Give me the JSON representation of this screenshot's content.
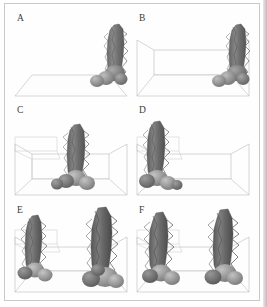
{
  "figure": {
    "layout": "2 columns x 3 rows",
    "background_color": "#ffffff",
    "frame_color": "#c9c9c9",
    "wireframe_color": "#b4b4b4",
    "object_colors": {
      "tree_dark": "#5e5e5e",
      "tree_mid": "#7d7d7d",
      "tree_light": "#a2a2a2",
      "sphere_dark": "#6f6f6f",
      "sphere_mid": "#8d8d8d",
      "sphere_light": "#b0b0b0"
    }
  },
  "panels": [
    {
      "id": "panel-a",
      "label": "A",
      "description": "Ground plane only with a single tree object at right",
      "has_room_box": false,
      "has_ground_plane": true,
      "has_shelf": false,
      "tree_count": 1,
      "tree_positions": [
        "right"
      ]
    },
    {
      "id": "panel-b",
      "label": "B",
      "description": "Wireframe room box added with a single tree object at right",
      "has_room_box": true,
      "has_ground_plane": true,
      "has_shelf": false,
      "tree_count": 1,
      "tree_positions": [
        "right"
      ]
    },
    {
      "id": "panel-c",
      "label": "C",
      "description": "Room box with left wall shelf and one tree near center",
      "has_room_box": true,
      "has_ground_plane": true,
      "has_shelf": true,
      "tree_count": 1,
      "tree_positions": [
        "center"
      ]
    },
    {
      "id": "panel-d",
      "label": "D",
      "description": "Room box with shelf and one tree at the left",
      "has_room_box": true,
      "has_ground_plane": true,
      "has_shelf": true,
      "tree_count": 1,
      "tree_positions": [
        "left"
      ]
    },
    {
      "id": "panel-e",
      "label": "E",
      "description": "Room box with shelf and two tree objects, small at left and large at right",
      "has_room_box": true,
      "has_ground_plane": true,
      "has_shelf": true,
      "tree_count": 2,
      "tree_positions": [
        "left",
        "right"
      ]
    },
    {
      "id": "panel-f",
      "label": "F",
      "description": "Room box with shelf and two tree objects of similar size at left and right",
      "has_room_box": true,
      "has_ground_plane": true,
      "has_shelf": true,
      "tree_count": 2,
      "tree_positions": [
        "left",
        "right"
      ]
    }
  ]
}
